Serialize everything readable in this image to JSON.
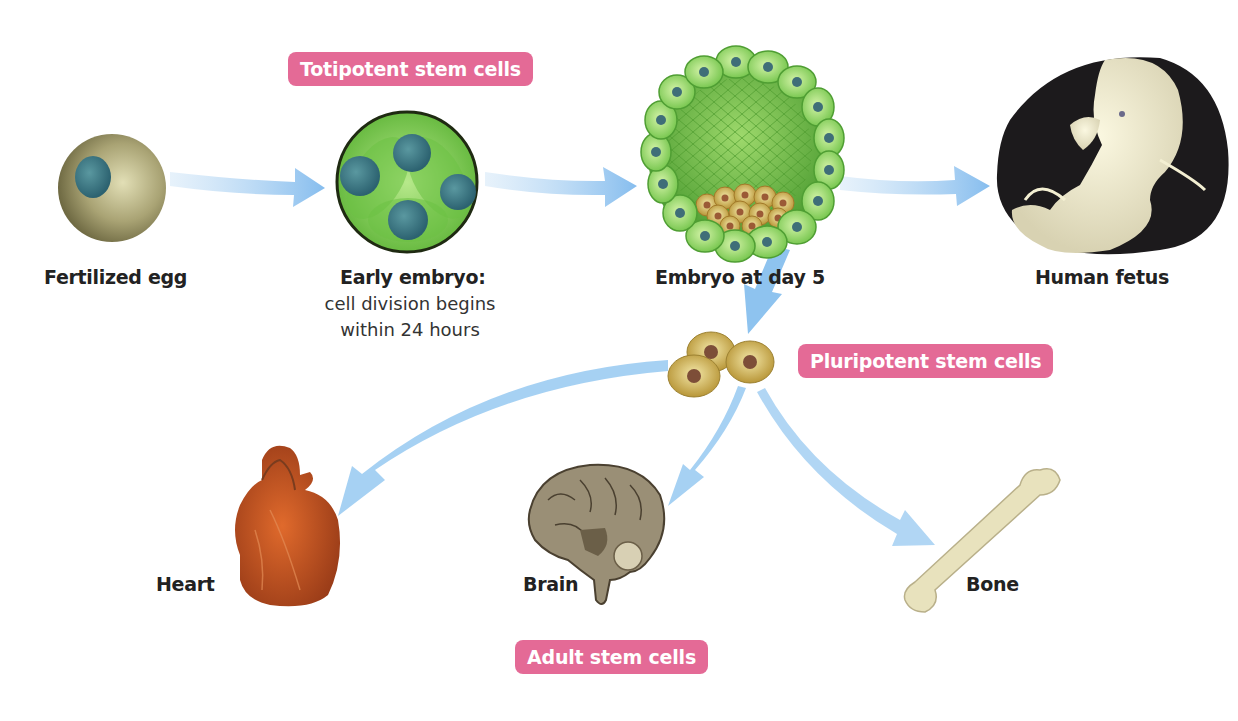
{
  "diagram": {
    "badges": {
      "totipotent": "Totipotent stem cells",
      "pluripotent": "Pluripotent stem cells",
      "adult": "Adult stem cells"
    },
    "stages": [
      {
        "id": "fertilized-egg",
        "label": "Fertilized egg"
      },
      {
        "id": "early-embryo",
        "label": "Early embryo:",
        "sublabel_line1": "cell division begins",
        "sublabel_line2": "within 24 hours"
      },
      {
        "id": "embryo-day-5",
        "label": "Embryo at day 5"
      },
      {
        "id": "human-fetus",
        "label": "Human fetus"
      }
    ],
    "tissues": [
      {
        "id": "heart",
        "label": "Heart"
      },
      {
        "id": "brain",
        "label": "Brain"
      },
      {
        "id": "bone",
        "label": "Bone"
      }
    ],
    "edges": [
      {
        "from": "fertilized-egg",
        "to": "early-embryo"
      },
      {
        "from": "early-embryo",
        "to": "embryo-day-5"
      },
      {
        "from": "embryo-day-5",
        "to": "human-fetus"
      },
      {
        "from": "embryo-day-5",
        "to": "pluripotent-cells"
      },
      {
        "from": "pluripotent-cells",
        "to": "heart"
      },
      {
        "from": "pluripotent-cells",
        "to": "brain"
      },
      {
        "from": "pluripotent-cells",
        "to": "bone"
      }
    ],
    "colors": {
      "badge": "#e46a96",
      "arrow": "#8ec3ef",
      "embryo_green": "#7ccf4f",
      "nucleus": "#3e6f7d",
      "pluripotent_cell": "#d2b457",
      "heart": "#c2521f",
      "brain": "#9a8f76",
      "bone": "#e8e2bd",
      "fetus_bg": "#1c1a1c"
    }
  }
}
